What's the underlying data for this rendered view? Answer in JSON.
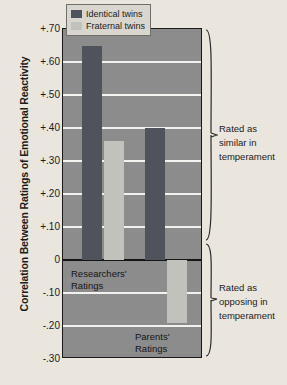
{
  "chart_data": {
    "type": "bar",
    "title": "",
    "xlabel": "",
    "ylabel": "Correlation Between Ratings of Emotional Reactivity",
    "ylim": [
      -0.3,
      0.7
    ],
    "grid": true,
    "legend_position": "top-center-inside",
    "categories": [
      "Researchers' Ratings",
      "Parents' Ratings"
    ],
    "series": [
      {
        "name": "Identical twins",
        "color": "#4f545c",
        "values": [
          0.65,
          0.4
        ]
      },
      {
        "name": "Fraternal twins",
        "color": "#c2c2bc",
        "values": [
          0.36,
          -0.19
        ]
      }
    ],
    "ytick_labels": [
      "+.70",
      "+.60",
      "+.50",
      "+.40",
      "+.30",
      "+.20",
      "+.10",
      "0",
      "-.10",
      "-.20",
      "-.30"
    ],
    "ytick_values": [
      0.7,
      0.6,
      0.5,
      0.4,
      0.3,
      0.2,
      0.1,
      0.0,
      -0.1,
      -0.2,
      -0.3
    ],
    "annotations": [
      {
        "text_line1": "Rated as",
        "text_line2": "similar in",
        "text_line3": "temperament",
        "region": "positive"
      },
      {
        "text_line1": "Rated as",
        "text_line2": "opposing in",
        "text_line3": "temperament",
        "region": "negative"
      }
    ]
  },
  "legend": {
    "items": [
      {
        "label": "Identical twins"
      },
      {
        "label": "Fraternal twins"
      }
    ]
  },
  "group_labels": {
    "researchers_line1": "Researchers'",
    "researchers_line2": "Ratings",
    "parents_line1": "Parents'",
    "parents_line2": "Ratings"
  },
  "annotations": {
    "similar_line1": "Rated as",
    "similar_line2": "similar in",
    "similar_line3": "temperament",
    "opposing_line1": "Rated as",
    "opposing_line2": "opposing in",
    "opposing_line3": "temperament"
  },
  "axis": {
    "y_title": "Correlation Between Ratings of Emotional Reactivity"
  },
  "colors": {
    "page_background": "#eae6de",
    "plot_background": "#8c8c8c",
    "identical": "#4f545c",
    "fraternal": "#c2c2bc",
    "gridline": "#f2f2ee",
    "axis_line": "#161616"
  }
}
